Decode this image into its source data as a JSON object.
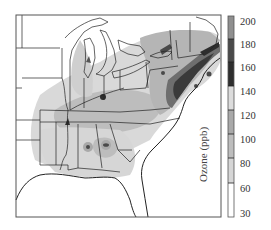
{
  "figure": {
    "type": "choropleth-map",
    "region": "Eastern United States",
    "colorbar": {
      "label": "Ozone (ppb)",
      "ticks": [
        "200",
        "180",
        "160",
        "140",
        "120",
        "100",
        "80",
        "60",
        "30"
      ],
      "bins": [
        {
          "range": "180-200",
          "color": "#8f8f8f"
        },
        {
          "range": "160-180",
          "color": "#4a4a4a"
        },
        {
          "range": "140-160",
          "color": "#2e2e2e"
        },
        {
          "range": "120-140",
          "color": "#dcdcdc"
        },
        {
          "range": "100-120",
          "color": "#a9a9a9"
        },
        {
          "range": "80-100",
          "color": "#bdbdbd"
        },
        {
          "range": "60-80",
          "color": "#d6d6d6"
        },
        {
          "range": "30-60",
          "color": "#ffffff"
        }
      ]
    },
    "hotspots": [
      "Northeast corridor (NY–Boston)",
      "Lake Michigan shore",
      "Lake Erie shore",
      "Ohio River valley",
      "Atlanta",
      "Birmingham"
    ]
  }
}
